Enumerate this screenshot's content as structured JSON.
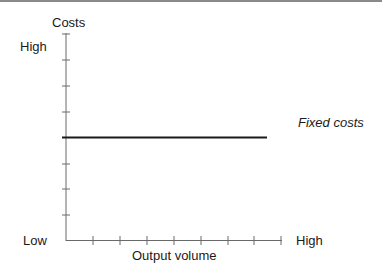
{
  "diagram": {
    "y_axis": {
      "label": "Costs",
      "high_label": "High",
      "low_label": "Low",
      "tick_count": 8
    },
    "x_axis": {
      "label": "Output volume",
      "high_label": "High",
      "tick_count": 8
    },
    "series": [
      {
        "name": "Fixed costs",
        "type": "horizontal-line",
        "level_fraction": 0.5
      }
    ],
    "colors": {
      "axis": "#6a6a6a",
      "line": "#1a1a1a",
      "text": "#1a1a1a"
    }
  }
}
